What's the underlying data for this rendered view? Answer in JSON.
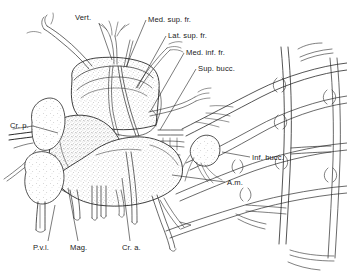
{
  "figure": {
    "background_color": "#ffffff",
    "ink_color": "#2a2a2a",
    "text_color": "#1a1a1a",
    "width": 347,
    "height": 273
  },
  "labels": [
    {
      "id": "vert",
      "text": "Vert.",
      "text_x": 75,
      "text_y": 20,
      "anchor": "start",
      "leader": "M 99,23 L 112,60",
      "region": "top-left"
    },
    {
      "id": "med-sup-fr",
      "text": "Med. sup. fr.",
      "text_x": 148,
      "text_y": 22,
      "anchor": "start",
      "leader": "M 146,20 L 126,67",
      "region": "top-right"
    },
    {
      "id": "lat-sup-fr",
      "text": "Lat. sup. fr.",
      "text_x": 168,
      "text_y": 38,
      "anchor": "start",
      "leader": "M 166,36 L 137,88",
      "region": "top-right"
    },
    {
      "id": "med-inf-fr",
      "text": "Med. inf. fr.",
      "text_x": 186,
      "text_y": 55,
      "anchor": "start",
      "leader": "M 184,53 L 150,112",
      "region": "top-right"
    },
    {
      "id": "sup-bucc",
      "text": "Sup. bucc.",
      "text_x": 198,
      "text_y": 71,
      "anchor": "start",
      "leader": "M 196,69 L 160,130",
      "region": "top-right"
    },
    {
      "id": "cr-p",
      "text": "Cr. p.",
      "text_x": 10,
      "text_y": 128,
      "anchor": "start",
      "leader": "M 33,126 L 58,133",
      "region": "left"
    },
    {
      "id": "inf-bucc",
      "text": "Inf. bucc.",
      "text_x": 252,
      "text_y": 160,
      "anchor": "start",
      "leader": "M 250,157 L 222,152",
      "region": "right"
    },
    {
      "id": "a-m",
      "text": "A.m.",
      "text_x": 227,
      "text_y": 185,
      "anchor": "start",
      "leader": "M 225,182 L 172,175",
      "region": "right"
    },
    {
      "id": "pvl",
      "text": "P.v.l.",
      "text_x": 33,
      "text_y": 250,
      "anchor": "start",
      "leader": "M 48,241 L 55,205",
      "region": "bottom"
    },
    {
      "id": "mag",
      "text": "Mag.",
      "text_x": 70,
      "text_y": 250,
      "anchor": "start",
      "leader": "M 78,241 L 68,188",
      "region": "bottom"
    },
    {
      "id": "cr-a",
      "text": "Cr. a.",
      "text_x": 122,
      "text_y": 250,
      "anchor": "start",
      "leader": "M 130,241 L 122,178",
      "region": "bottom"
    }
  ]
}
